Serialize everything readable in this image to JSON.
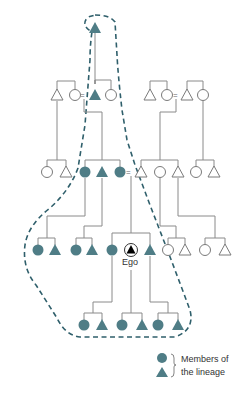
{
  "diagram": {
    "type": "kinship-lineage",
    "colors": {
      "member_fill": "#4f7d86",
      "outline_dash": "#2f5f6b",
      "ego_fill": "#000000",
      "line": "#8a8a8a"
    },
    "ego_label": "Ego",
    "marriage_symbol": "=",
    "generations": [
      {
        "level": 1,
        "members": [
          {
            "shape": "triangle",
            "x": 95,
            "y": 28,
            "lineage": true
          }
        ]
      },
      {
        "level": 2,
        "members": [
          {
            "shape": "triangle",
            "x": 57,
            "y": 95,
            "lineage": false
          },
          {
            "shape": "circle",
            "x": 75,
            "y": 95,
            "lineage": false
          },
          {
            "shape": "triangle",
            "x": 95,
            "y": 95,
            "lineage": true
          },
          {
            "shape": "circle",
            "x": 111,
            "y": 95,
            "lineage": false
          },
          {
            "shape": "triangle",
            "x": 150,
            "y": 95,
            "lineage": false
          },
          {
            "shape": "circle",
            "x": 167,
            "y": 95,
            "lineage": false
          },
          {
            "shape": "triangle",
            "x": 187,
            "y": 95,
            "lineage": false
          },
          {
            "shape": "circle",
            "x": 203,
            "y": 95,
            "lineage": false
          }
        ]
      },
      {
        "level": 3,
        "members": [
          {
            "shape": "circle",
            "x": 47,
            "y": 172,
            "lineage": false
          },
          {
            "shape": "triangle",
            "x": 66,
            "y": 172,
            "lineage": false
          },
          {
            "shape": "circle",
            "x": 85,
            "y": 172,
            "lineage": true
          },
          {
            "shape": "triangle",
            "x": 102,
            "y": 172,
            "lineage": true
          },
          {
            "shape": "circle",
            "x": 120,
            "y": 172,
            "lineage": true
          },
          {
            "shape": "triangle",
            "x": 141,
            "y": 172,
            "lineage": false
          },
          {
            "shape": "circle",
            "x": 160,
            "y": 172,
            "lineage": false
          },
          {
            "shape": "triangle",
            "x": 178,
            "y": 172,
            "lineage": false
          },
          {
            "shape": "circle",
            "x": 196,
            "y": 172,
            "lineage": false
          },
          {
            "shape": "triangle",
            "x": 214,
            "y": 172,
            "lineage": false
          }
        ]
      },
      {
        "level": 4,
        "members": [
          {
            "shape": "circle",
            "x": 38,
            "y": 250,
            "lineage": true
          },
          {
            "shape": "triangle",
            "x": 55,
            "y": 250,
            "lineage": true
          },
          {
            "shape": "circle",
            "x": 76,
            "y": 250,
            "lineage": true
          },
          {
            "shape": "triangle",
            "x": 92,
            "y": 250,
            "lineage": true
          },
          {
            "shape": "circle",
            "x": 112,
            "y": 250,
            "lineage": true
          },
          {
            "shape": "ego",
            "x": 131,
            "y": 250,
            "lineage": true
          },
          {
            "shape": "triangle",
            "x": 150,
            "y": 250,
            "lineage": true
          },
          {
            "shape": "circle",
            "x": 168,
            "y": 250,
            "lineage": false
          },
          {
            "shape": "triangle",
            "x": 185,
            "y": 250,
            "lineage": false
          },
          {
            "shape": "circle",
            "x": 205,
            "y": 250,
            "lineage": false
          },
          {
            "shape": "triangle",
            "x": 225,
            "y": 250,
            "lineage": false
          }
        ]
      },
      {
        "level": 5,
        "members": [
          {
            "shape": "circle",
            "x": 84,
            "y": 325,
            "lineage": true
          },
          {
            "shape": "triangle",
            "x": 102,
            "y": 325,
            "lineage": true
          },
          {
            "shape": "circle",
            "x": 122,
            "y": 325,
            "lineage": true
          },
          {
            "shape": "triangle",
            "x": 142,
            "y": 325,
            "lineage": true
          },
          {
            "shape": "circle",
            "x": 158,
            "y": 325,
            "lineage": true
          },
          {
            "shape": "triangle",
            "x": 178,
            "y": 325,
            "lineage": true
          }
        ]
      }
    ],
    "legend": {
      "line1": "Members of",
      "line2": "the lineage"
    }
  }
}
